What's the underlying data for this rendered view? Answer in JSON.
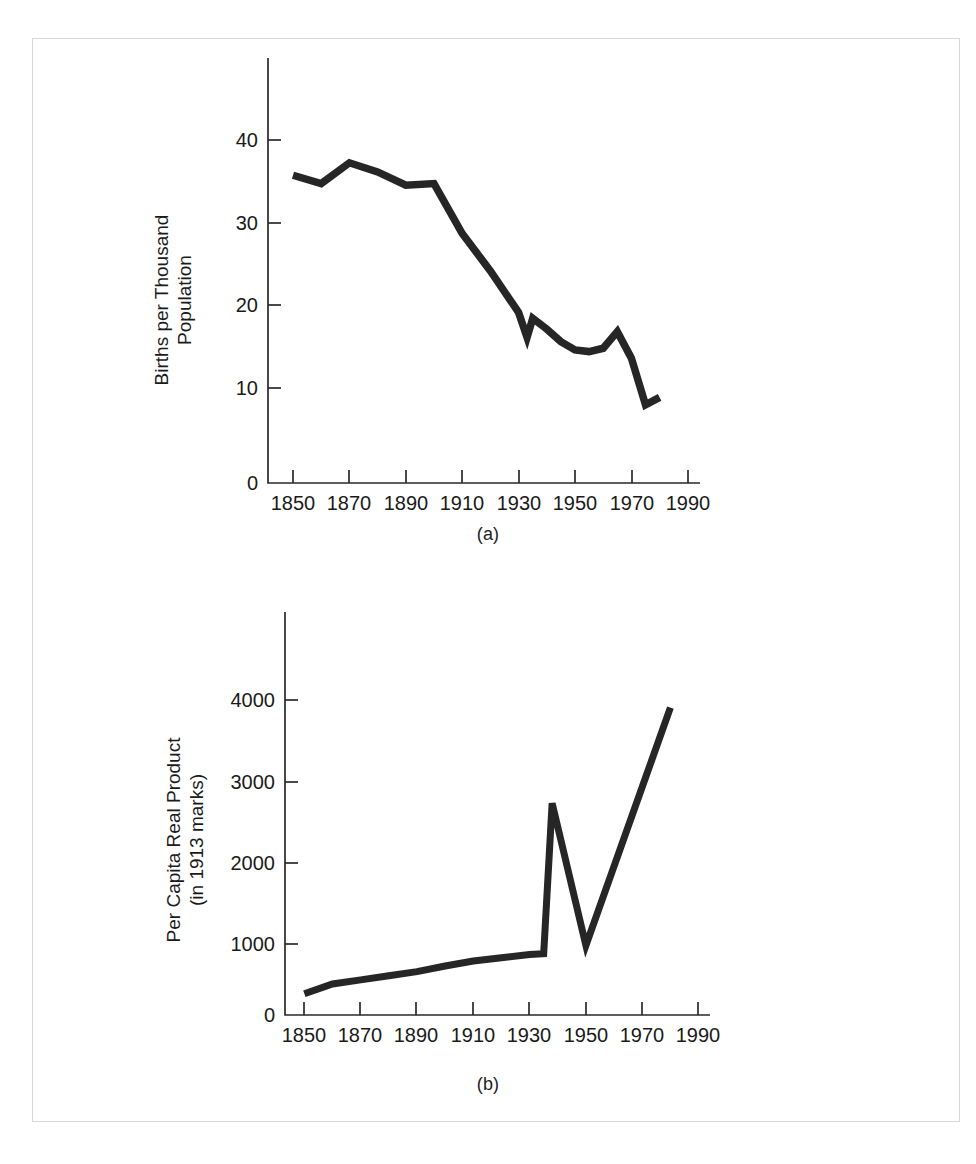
{
  "page": {
    "background": "#ffffff",
    "frame_color": "#d8d8d8",
    "ink_color": "#262626"
  },
  "figures": [
    {
      "caption": "(a)",
      "ylabel_line1": "Births per Thousand",
      "ylabel_line2": "Population",
      "ytick_labels": [
        "0",
        "10",
        "20",
        "30",
        "40"
      ],
      "xtick_labels": [
        "1850",
        "1870",
        "1890",
        "1910",
        "1930",
        "1950",
        "1970",
        "1990"
      ]
    },
    {
      "caption": "(b)",
      "ylabel_line1": "Per Capita Real Product",
      "ylabel_line2": "(in 1913 marks)",
      "ytick_labels": [
        "0",
        "1000",
        "2000",
        "3000",
        "4000"
      ],
      "xtick_labels": [
        "1850",
        "1870",
        "1890",
        "1910",
        "1930",
        "1950",
        "1970",
        "1990"
      ]
    }
  ],
  "chart_data": [
    {
      "type": "line",
      "title": "",
      "subtitle": "(a)",
      "xlabel": "",
      "ylabel": "Births per Thousand Population",
      "xlim": [
        1840,
        2000
      ],
      "ylim": [
        0,
        47
      ],
      "xticks": [
        1850,
        1870,
        1890,
        1910,
        1930,
        1950,
        1970,
        1990
      ],
      "yticks": [
        0,
        10,
        20,
        30,
        40
      ],
      "grid": false,
      "legend": "none",
      "series": [
        {
          "name": "Births per thousand population",
          "x": [
            1850,
            1860,
            1870,
            1880,
            1890,
            1900,
            1910,
            1920,
            1930,
            1933,
            1935,
            1940,
            1945,
            1950,
            1955,
            1960,
            1965,
            1970,
            1975,
            1980
          ],
          "values": [
            37.0,
            36.0,
            38.5,
            37.4,
            35.8,
            36.0,
            30.0,
            25.5,
            20.5,
            17.5,
            19.8,
            18.5,
            17.0,
            16.0,
            15.8,
            16.2,
            18.2,
            15.0,
            9.4,
            10.3
          ]
        }
      ]
    },
    {
      "type": "line",
      "title": "",
      "subtitle": "(b)",
      "xlabel": "",
      "ylabel": "Per Capita Real Product (in 1913 marks)",
      "xlim": [
        1840,
        2000
      ],
      "ylim": [
        0,
        4800
      ],
      "xticks": [
        1850,
        1870,
        1890,
        1910,
        1930,
        1950,
        1970,
        1990
      ],
      "yticks": [
        0,
        1000,
        2000,
        3000,
        4000
      ],
      "grid": false,
      "legend": "none",
      "series": [
        {
          "name": "Per capita real product (1913 marks)",
          "x": [
            1850,
            1860,
            1870,
            1880,
            1890,
            1900,
            1910,
            1920,
            1930,
            1935,
            1938,
            1950,
            1980
          ],
          "values": [
            260,
            380,
            430,
            480,
            530,
            600,
            660,
            700,
            740,
            750,
            2590,
            850,
            3760
          ]
        }
      ]
    }
  ]
}
